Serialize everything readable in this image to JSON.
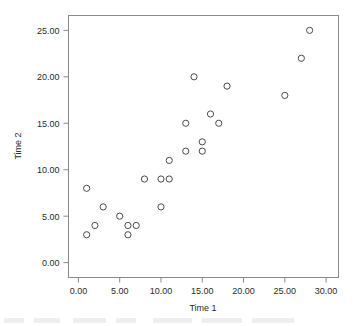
{
  "chart_data": {
    "type": "scatter",
    "title": "",
    "xlabel": "Time 1",
    "ylabel": "Time 2",
    "xlim": [
      -1.2,
      31.5
    ],
    "ylim": [
      -1.6,
      26.6
    ],
    "xticks": [
      0,
      5,
      10,
      15,
      20,
      25,
      30
    ],
    "xticklabels": [
      "0.00",
      "5.00",
      "10.00",
      "15.00",
      "20.00",
      "25.00",
      "30.00"
    ],
    "yticks": [
      0,
      5,
      10,
      15,
      20,
      25
    ],
    "yticklabels": [
      "0.00",
      "5.00",
      "10.00",
      "15.00",
      "20.00",
      "25.00"
    ],
    "grid": false,
    "legend": null,
    "marker": "open-circle",
    "marker_color": "#4a4a4a",
    "frame_color": "#8a8a8a",
    "x": [
      1,
      1,
      2,
      3,
      5,
      6,
      6,
      7,
      8,
      10,
      10,
      11,
      11,
      13,
      13,
      14,
      15,
      15,
      16,
      17,
      18,
      25,
      27,
      28
    ],
    "y": [
      3,
      8,
      4,
      6,
      5,
      3,
      4,
      4,
      9,
      6,
      9,
      9,
      11,
      12,
      15,
      20,
      12,
      13,
      16,
      15,
      19,
      18,
      22,
      25
    ],
    "points": [
      {
        "x": 1,
        "y": 3
      },
      {
        "x": 1,
        "y": 8
      },
      {
        "x": 2,
        "y": 4
      },
      {
        "x": 3,
        "y": 6
      },
      {
        "x": 5,
        "y": 5
      },
      {
        "x": 6,
        "y": 3
      },
      {
        "x": 6,
        "y": 4
      },
      {
        "x": 7,
        "y": 4
      },
      {
        "x": 8,
        "y": 9
      },
      {
        "x": 10,
        "y": 6
      },
      {
        "x": 10,
        "y": 9
      },
      {
        "x": 11,
        "y": 9
      },
      {
        "x": 11,
        "y": 11
      },
      {
        "x": 13,
        "y": 12
      },
      {
        "x": 13,
        "y": 15
      },
      {
        "x": 14,
        "y": 20
      },
      {
        "x": 15,
        "y": 12
      },
      {
        "x": 15,
        "y": 13
      },
      {
        "x": 16,
        "y": 16
      },
      {
        "x": 17,
        "y": 15
      },
      {
        "x": 18,
        "y": 19
      },
      {
        "x": 25,
        "y": 18
      },
      {
        "x": 27,
        "y": 22
      },
      {
        "x": 28,
        "y": 25
      }
    ]
  }
}
